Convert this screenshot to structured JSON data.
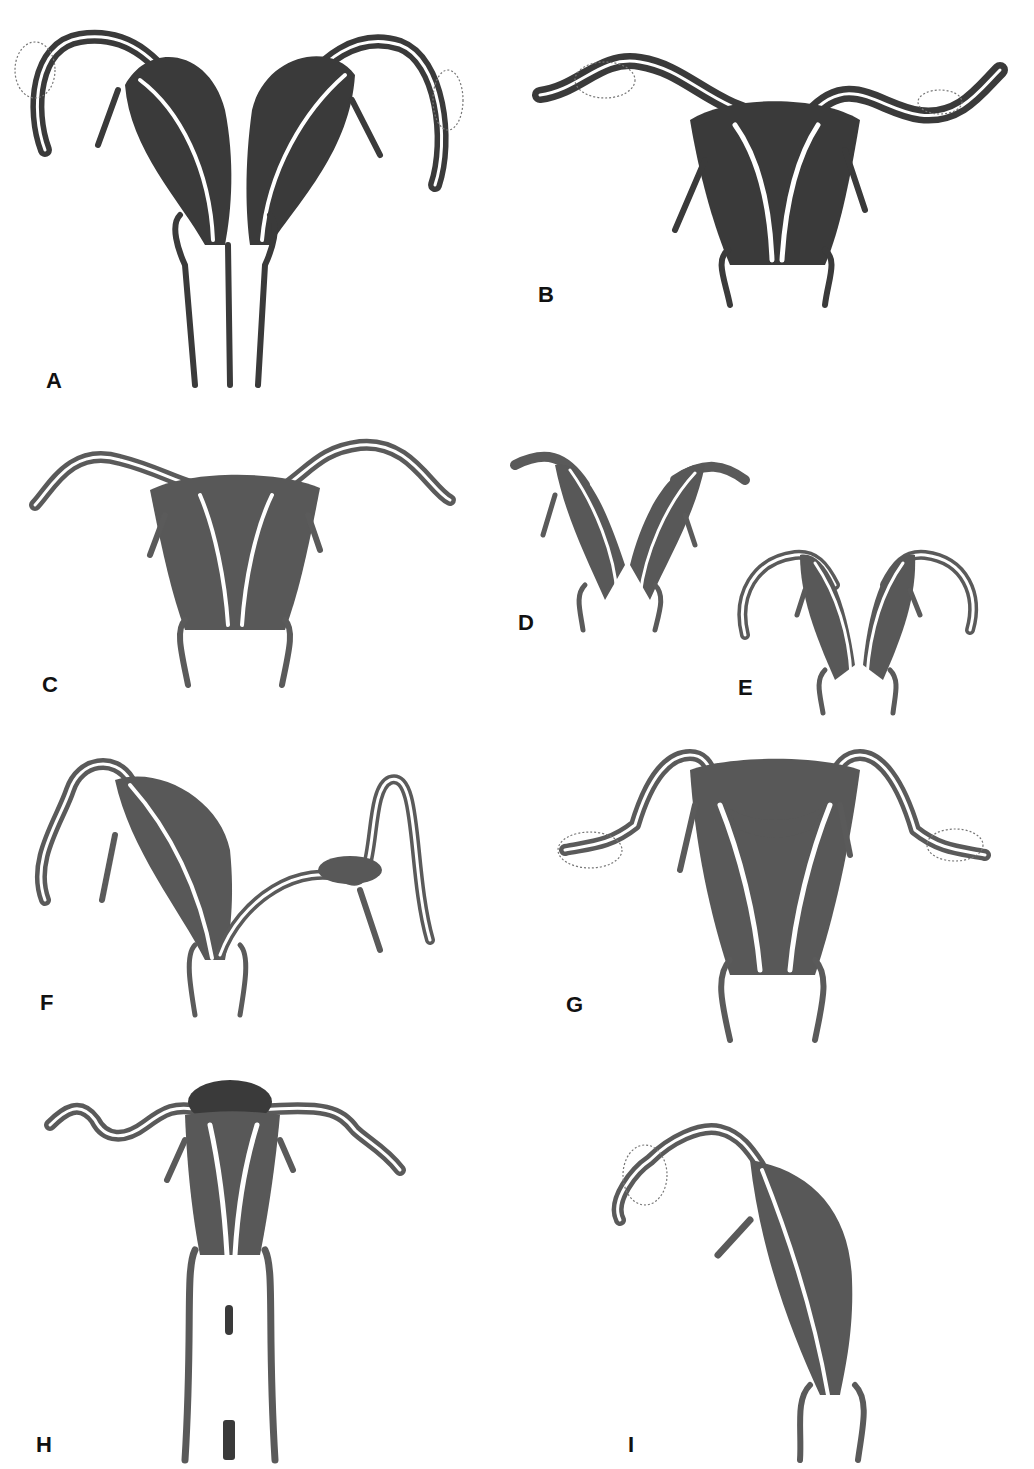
{
  "figure": {
    "type": "anatomical diagram",
    "panels": [
      {
        "id": "A",
        "label": "A"
      },
      {
        "id": "B",
        "label": "B"
      },
      {
        "id": "C",
        "label": "C"
      },
      {
        "id": "D",
        "label": "D"
      },
      {
        "id": "E",
        "label": "E"
      },
      {
        "id": "F",
        "label": "F"
      },
      {
        "id": "G",
        "label": "G"
      },
      {
        "id": "H",
        "label": "H"
      },
      {
        "id": "I",
        "label": "I"
      }
    ],
    "colors": {
      "ink_dark": "#3a3a3a",
      "ink_mid": "#585858",
      "background": "#ffffff"
    }
  }
}
